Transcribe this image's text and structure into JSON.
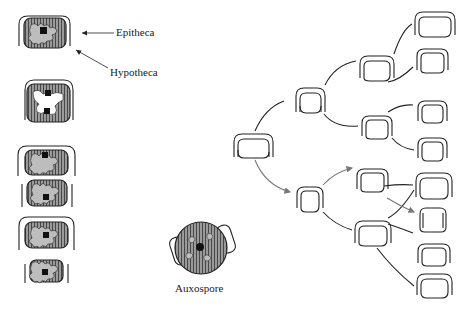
{
  "figure": {
    "labels": {
      "epitheca": "Epitheca",
      "hypotheca": "Hypotheca",
      "auxospore": "Auxospore"
    },
    "colors": {
      "line": "#333333",
      "arrow": "#777777",
      "cytoplasm": "#9a9a9a",
      "nucleus": "#111111",
      "background": "#ffffff"
    },
    "left_sequence": [
      {
        "id": "stage-1",
        "description": "Single cell with epitheca and hypotheca"
      },
      {
        "id": "stage-2",
        "description": "Cell with dividing nucleus"
      },
      {
        "id": "stage-3",
        "description": "Two daughter cells forming inside parent frustule"
      },
      {
        "id": "stage-4",
        "description": "Two separated daughter cells"
      }
    ],
    "tree": {
      "generations": 4,
      "nodes_per_generation": [
        1,
        2,
        4,
        8
      ],
      "highlighted_lineage": "gray arrows trace the progressively smaller hypotheca lineage"
    }
  }
}
